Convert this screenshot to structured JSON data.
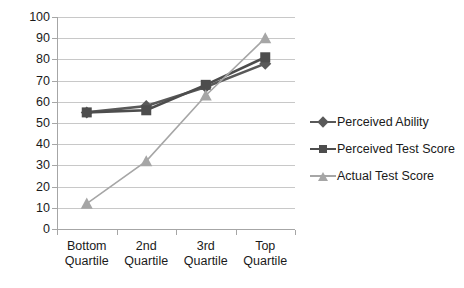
{
  "chart_data": {
    "type": "line",
    "title": "",
    "subtitle": "",
    "xlabel": "",
    "ylabel": "",
    "categories": [
      "Bottom Quartile",
      "2nd Quartile",
      "3rd Quartile",
      "Top Quartile"
    ],
    "category_lines": [
      [
        "Bottom",
        "Quartile"
      ],
      [
        "2nd",
        "Quartile"
      ],
      [
        "3rd",
        "Quartile"
      ],
      [
        "Top",
        "Quartile"
      ]
    ],
    "ylim": [
      0,
      100
    ],
    "y_ticks": [
      0,
      10,
      20,
      30,
      40,
      50,
      60,
      70,
      80,
      90,
      100
    ],
    "y_tick_labels": [
      "0",
      "10",
      "20",
      "30",
      "40",
      "50",
      "60",
      "70",
      "80",
      "90",
      "100"
    ],
    "grid": true,
    "legend_position": "right",
    "series": [
      {
        "name": "Perceived Ability",
        "marker": "diamond",
        "color": "#595959",
        "values": [
          55,
          58,
          67,
          78
        ]
      },
      {
        "name": "Perceived Test Score",
        "marker": "square",
        "color": "#4d4d4d",
        "values": [
          55,
          56,
          68,
          81
        ]
      },
      {
        "name": "Actual Test Score",
        "marker": "triangle",
        "color": "#a6a6a6",
        "values": [
          12,
          32,
          63,
          90
        ]
      }
    ]
  },
  "legend": {
    "items": [
      {
        "label": "Perceived Ability",
        "marker": "diamond",
        "color": "#595959"
      },
      {
        "label": "Perceived Test Score",
        "marker": "square",
        "color": "#4d4d4d"
      },
      {
        "label": "Actual Test Score",
        "marker": "triangle",
        "color": "#a6a6a6"
      }
    ]
  },
  "axes": {
    "grid_color": "#c8c8c8",
    "axis_color": "#a6a6a6",
    "label_color": "#1a1a1a"
  }
}
